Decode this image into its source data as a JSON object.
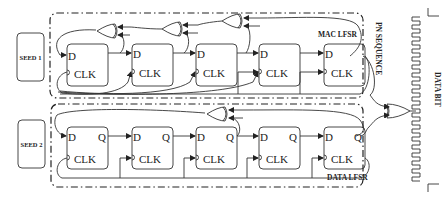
{
  "diagram": {
    "seed_blocks": [
      {
        "label": "SEED 1"
      },
      {
        "label": "SEED 2"
      }
    ],
    "mac_lfsr": {
      "title": "MAC LFSR",
      "flip_flops": [
        {
          "d": "D",
          "clk": "CLK",
          "q": ""
        },
        {
          "d": "D",
          "clk": "CLK",
          "q": ""
        },
        {
          "d": "D",
          "clk": "CLK",
          "q": ""
        },
        {
          "d": "D",
          "clk": "CLK",
          "q": ""
        },
        {
          "d": "D",
          "clk": "CLK",
          "q": ""
        }
      ],
      "xor_gates": 3
    },
    "data_lfsr": {
      "title": "DATA LFSR",
      "flip_flops": [
        {
          "d": "D",
          "clk": "CLK",
          "q": "Q"
        },
        {
          "d": "D",
          "clk": "CLK",
          "q": "Q"
        },
        {
          "d": "D",
          "clk": "CLK",
          "q": "Q"
        },
        {
          "d": "D",
          "clk": "CLK",
          "q": "Q"
        },
        {
          "d": "D",
          "clk": "CLK",
          "q": "Q"
        }
      ],
      "xor_gates": 1
    },
    "output_xor": "XOR",
    "pn_sequence_label": "PN SEQUENCE",
    "data_bit_label": "DATA BIT"
  }
}
